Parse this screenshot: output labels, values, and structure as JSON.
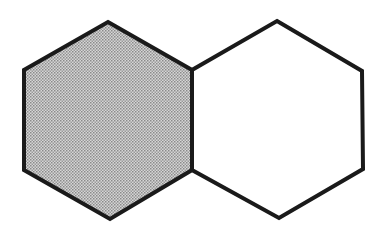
{
  "diagram": {
    "stroke_color": "#1a1a1a",
    "stroke_width": 4,
    "shapes": [
      {
        "name": "left-hexagon",
        "fill": "#bdbdbd",
        "shaded": true,
        "points": [
          [
            108,
            22
          ],
          [
            192,
            70
          ],
          [
            192,
            170
          ],
          [
            110,
            219
          ],
          [
            24,
            170
          ],
          [
            24,
            70
          ]
        ]
      },
      {
        "name": "right-hexagon",
        "fill": "#ffffff",
        "shaded": false,
        "points": [
          [
            277,
            21
          ],
          [
            362,
            71
          ],
          [
            363,
            169
          ],
          [
            279,
            218
          ],
          [
            192,
            170
          ],
          [
            192,
            70
          ]
        ]
      }
    ]
  }
}
